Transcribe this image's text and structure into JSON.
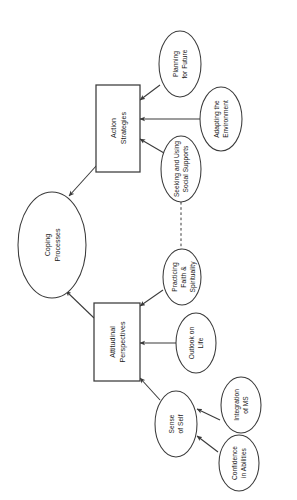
{
  "figure": {
    "orientation": "rotated-90-clockwise",
    "background_color": "#ffffff",
    "line_color": "#3a3a3a",
    "text_color": "#1a1a1a"
  },
  "nodes": {
    "coping_processes": {
      "label_line1": "Coping",
      "label_line2": "Processes",
      "shape": "ellipse"
    },
    "action_strategies": {
      "label_line1": "Action",
      "label_line2": "Strategies",
      "shape": "rectangle"
    },
    "attitudinal_perspectives": {
      "label_line1": "Attitudinal",
      "label_line2": "Perspectives",
      "shape": "rectangle"
    },
    "planning_for_future": {
      "label_line1": "Planning",
      "label_line2": "for Future",
      "shape": "ellipse"
    },
    "adapting_the_environment": {
      "label_line1": "Adapting the",
      "label_line2": "Environment",
      "shape": "ellipse"
    },
    "seeking_social_supports": {
      "label_line1": "Seeking and Using",
      "label_line2": "Social Supports",
      "shape": "ellipse"
    },
    "practicing_faith": {
      "label_line1": "Practicing",
      "label_line2": "Faith &",
      "label_line3": "Spirituality",
      "shape": "ellipse"
    },
    "outlook_on_life": {
      "label_line1": "Outlook on",
      "label_line2": "Life",
      "shape": "ellipse"
    },
    "sense_of_self": {
      "label_line1": "Sense",
      "label_line2": "of Self",
      "shape": "ellipse"
    },
    "integration_of_ms": {
      "label_line1": "Integration",
      "label_line2": "of MS",
      "shape": "ellipse"
    },
    "confidence_in_abilities": {
      "label_line1": "Confidence",
      "label_line2": "in Abilities",
      "shape": "ellipse"
    }
  },
  "edges": [
    {
      "from": "action_strategies",
      "to": "coping_processes",
      "style": "solid",
      "arrow": true
    },
    {
      "from": "attitudinal_perspectives",
      "to": "coping_processes",
      "style": "solid",
      "arrow": true
    },
    {
      "from": "planning_for_future",
      "to": "action_strategies",
      "style": "solid",
      "arrow": true
    },
    {
      "from": "adapting_the_environment",
      "to": "action_strategies",
      "style": "solid",
      "arrow": true
    },
    {
      "from": "seeking_social_supports",
      "to": "action_strategies",
      "style": "solid",
      "arrow": true
    },
    {
      "from": "practicing_faith",
      "to": "attitudinal_perspectives",
      "style": "solid",
      "arrow": true
    },
    {
      "from": "outlook_on_life",
      "to": "attitudinal_perspectives",
      "style": "solid",
      "arrow": true
    },
    {
      "from": "sense_of_self",
      "to": "attitudinal_perspectives",
      "style": "solid",
      "arrow": true
    },
    {
      "from": "integration_of_ms",
      "to": "sense_of_self",
      "style": "solid",
      "arrow": true
    },
    {
      "from": "confidence_in_abilities",
      "to": "sense_of_self",
      "style": "solid",
      "arrow": true
    },
    {
      "from": "seeking_social_supports",
      "to": "practicing_faith",
      "style": "dashed",
      "arrow": false
    }
  ],
  "cursor": {
    "name": "mouse-pointer",
    "visible": true
  }
}
